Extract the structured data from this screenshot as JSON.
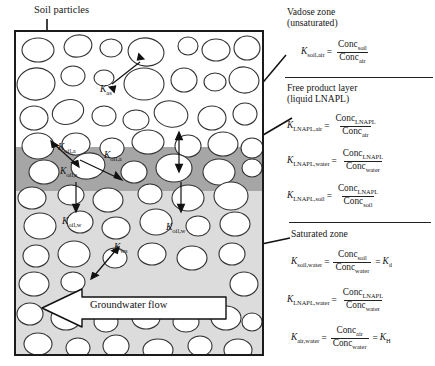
{
  "diagram": {
    "title_label": "Soil particles",
    "groundwater_flow_label": "Groundwater flow",
    "zones": {
      "vadose": "vadose-zone",
      "napl": "free-product-napl-layer",
      "saturated": "saturated-zone"
    },
    "partition_labels": [
      {
        "id": "k-as",
        "base": "K",
        "sub": "as",
        "x": 84,
        "y": 57
      },
      {
        "id": "k-oil-a-1",
        "base": "K",
        "sub": "oil,a",
        "x": 48,
        "y": 117
      },
      {
        "id": "k-oil-a-2",
        "base": "K",
        "sub": "oil,a",
        "x": 100,
        "y": 127
      },
      {
        "id": "k-oil-s",
        "base": "K",
        "sub": "oil,s",
        "x": 50,
        "y": 143
      },
      {
        "id": "k-oil-w-1",
        "base": "K",
        "sub": "oil,w",
        "x": 70,
        "y": 200
      },
      {
        "id": "k-oil-w-2",
        "base": "K",
        "sub": "oil,w",
        "x": 175,
        "y": 207
      },
      {
        "id": "k-ws",
        "base": "K",
        "sub": "ws",
        "x": 118,
        "y": 239
      }
    ]
  },
  "panel": {
    "sections": [
      {
        "id": "vadose",
        "heading_line1": "Vadose zone",
        "heading_line2": "(unsaturated)",
        "equations": [
          {
            "id": "k-soil-air",
            "lhs_sub": "soil,air",
            "num_sub": "soil",
            "den_sub": "air",
            "tail": ""
          }
        ]
      },
      {
        "id": "napl",
        "heading_line1": "Free product layer",
        "heading_line2": "(liquid LNAPL)",
        "equations": [
          {
            "id": "k-lnapl-air",
            "lhs_sub": "LNAPL,air",
            "num_sub": "LNAPL",
            "den_sub": "air",
            "tail": ""
          },
          {
            "id": "k-lnapl-water",
            "lhs_sub": "LNAPL,water",
            "num_sub": "LNAPL",
            "den_sub": "water",
            "tail": ""
          },
          {
            "id": "k-lnapl-soil",
            "lhs_sub": "LNAPL,soil",
            "num_sub": "LNAPL",
            "den_sub": "soil",
            "tail": ""
          }
        ]
      },
      {
        "id": "saturated",
        "heading_line1": "Saturated zone",
        "heading_line2": "",
        "equations": [
          {
            "id": "k-soil-water",
            "lhs_sub": "soil,water",
            "num_sub": "soil",
            "den_sub": "water",
            "tail": "Kd"
          },
          {
            "id": "k-lnapl-water-2",
            "lhs_sub": "LNAPL,water",
            "num_sub": "LNAPL",
            "den_sub": "water",
            "tail": ""
          },
          {
            "id": "k-air-water",
            "lhs_sub": "air,water",
            "num_sub": "air",
            "den_sub": "water",
            "tail": "KH"
          }
        ]
      }
    ],
    "symbols": {
      "K": "K",
      "Conc": "Conc",
      "equals": "=",
      "Kd_base": "K",
      "Kd_sub": "d",
      "KH_base": "K",
      "KH_sub": "H"
    }
  },
  "colors": {
    "vadose_fill": "#ffffff",
    "napl_fill": "#a6a6a6",
    "saturated_fill": "#dcdcdc",
    "grain_fill": "#ffffff",
    "outline": "#1a1a1a",
    "text": "#161616"
  }
}
